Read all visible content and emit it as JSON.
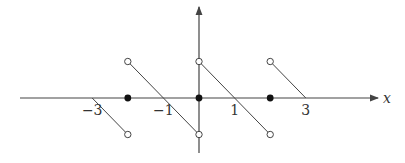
{
  "chart_data": {
    "type": "line",
    "title": "",
    "xlabel": "x",
    "ylabel": "",
    "x_ticks": [
      {
        "value": -3,
        "label": "−3"
      },
      {
        "value": -1,
        "label": "−1"
      },
      {
        "value": 1,
        "label": "1"
      },
      {
        "value": 3,
        "label": "3"
      }
    ],
    "xlim": [
      -5,
      5
    ],
    "ylim": [
      -1.5,
      2.5
    ],
    "grid": false,
    "segments": [
      {
        "from": [
          -3,
          0
        ],
        "to": [
          -2,
          -1
        ]
      },
      {
        "from": [
          -2,
          1
        ],
        "to": [
          0,
          -1
        ]
      },
      {
        "from": [
          0,
          1
        ],
        "to": [
          2,
          -1
        ]
      },
      {
        "from": [
          2,
          1
        ],
        "to": [
          3,
          0
        ]
      }
    ],
    "open_points": [
      [
        -2,
        1
      ],
      [
        -2,
        -1
      ],
      [
        0,
        1
      ],
      [
        0,
        -1
      ],
      [
        2,
        1
      ],
      [
        2,
        -1
      ]
    ],
    "filled_points": [
      [
        -2,
        0
      ],
      [
        0,
        0
      ],
      [
        2,
        0
      ]
    ]
  },
  "axes": {
    "x_label": "x"
  },
  "colors": {
    "axis": "#444444",
    "line": "#444444",
    "point": "#111111"
  }
}
